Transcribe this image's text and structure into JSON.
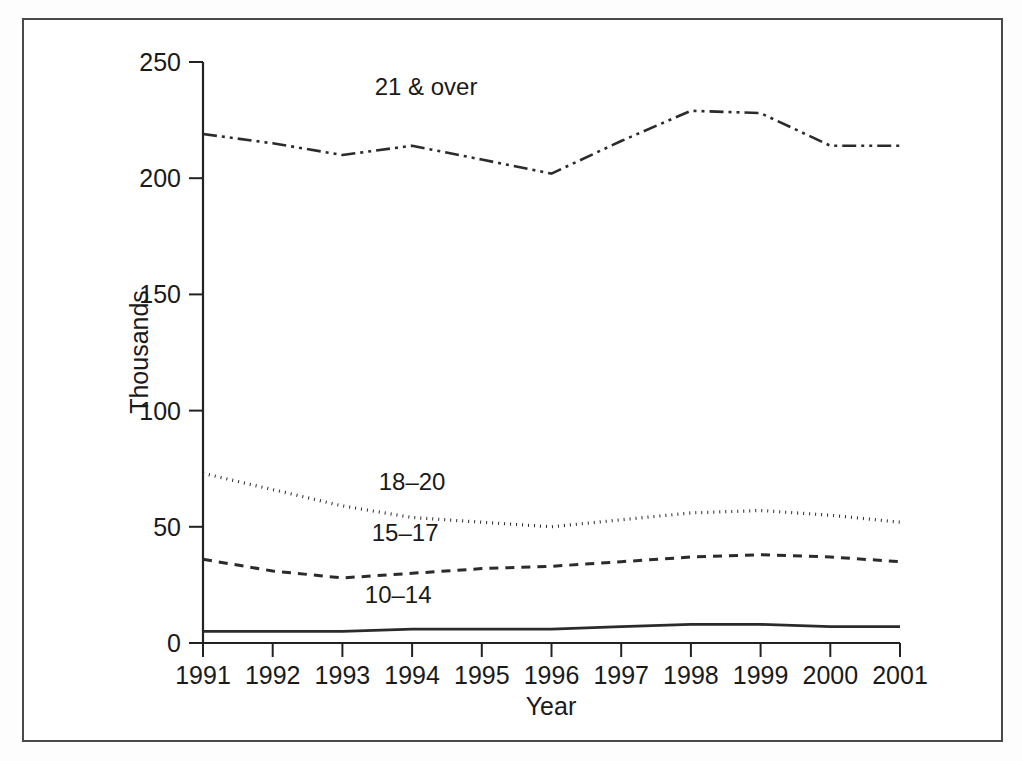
{
  "figure": {
    "background_color": "#ffffff",
    "frame_color": "#4a4a4a",
    "line_color": "#2b2b2b"
  },
  "chart_data": {
    "type": "line",
    "title": "",
    "subtitle": "",
    "xlabel": "Year",
    "ylabel": "Thousands",
    "x": [
      1991,
      1992,
      1993,
      1994,
      1995,
      1996,
      1997,
      1998,
      1999,
      2000,
      2001
    ],
    "xtick_labels": [
      "1991",
      "1992",
      "1993",
      "1994",
      "1995",
      "1996",
      "1997",
      "1998",
      "1999",
      "2000",
      "2001"
    ],
    "ytick_labels": [
      "0",
      "50",
      "100",
      "150",
      "200",
      "250"
    ],
    "yticks": [
      0,
      50,
      100,
      150,
      200,
      250
    ],
    "ylim": [
      0,
      250
    ],
    "xlim": [
      1991,
      2001
    ],
    "grid": false,
    "legend_position": "inline-annotations",
    "series": [
      {
        "name": "21 & over",
        "label": "21 & over",
        "linestyle": "dash-dot-dot",
        "dasharray": "14,5,3,5,3,5",
        "linewidth": 2.6,
        "color": "#2b2b2b",
        "values": [
          219,
          215,
          210,
          214,
          208,
          202,
          216,
          229,
          228,
          214,
          214
        ]
      },
      {
        "name": "18-20",
        "label": "18–20",
        "linestyle": "dotted",
        "dasharray": "1,5",
        "linewidth": 3.2,
        "color": "#2b2b2b",
        "values": [
          73,
          66,
          59,
          54,
          52,
          50,
          53,
          56,
          57,
          55,
          52
        ]
      },
      {
        "name": "15-17",
        "label": "15–17",
        "linestyle": "dashed",
        "dasharray": "9,7",
        "linewidth": 3.0,
        "color": "#2b2b2b",
        "values": [
          36,
          31,
          28,
          30,
          32,
          33,
          35,
          37,
          38,
          37,
          35
        ]
      },
      {
        "name": "10-14",
        "label": "10–14",
        "linestyle": "solid",
        "dasharray": "none",
        "linewidth": 2.8,
        "color": "#2b2b2b",
        "values": [
          5,
          5,
          5,
          6,
          6,
          6,
          7,
          8,
          8,
          7,
          7
        ]
      }
    ],
    "annotations": [
      {
        "text": "21 & over",
        "x": 1994.2,
        "y": 236,
        "series": "21 & over"
      },
      {
        "text": "18–20",
        "x": 1994.0,
        "y": 66,
        "series": "18-20"
      },
      {
        "text": "15–17",
        "x": 1993.9,
        "y": 44,
        "series": "15-17"
      },
      {
        "text": "10–14",
        "x": 1993.8,
        "y": 17,
        "series": "10-14"
      }
    ]
  }
}
